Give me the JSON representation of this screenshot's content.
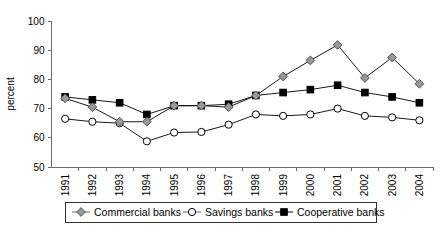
{
  "chart_data": {
    "type": "line",
    "title": "",
    "xlabel": "",
    "ylabel": "percent",
    "categories": [
      "1991",
      "1992",
      "1993",
      "1994",
      "1995",
      "1996",
      "1997",
      "1998",
      "1999",
      "2000",
      "2001",
      "2002",
      "2003",
      "2004"
    ],
    "ylim": [
      50,
      100
    ],
    "yticks": [
      50,
      60,
      70,
      80,
      90,
      100
    ],
    "grid": false,
    "legend_position": "bottom",
    "series": [
      {
        "name": "Commercial banks",
        "marker": "diamond",
        "marker_fill": "#999999",
        "marker_stroke": "#555555",
        "line_color": "#6b6b6b",
        "values": [
          73.5,
          70.5,
          65.5,
          65.5,
          71.0,
          71.0,
          70.5,
          74.5,
          81.0,
          86.5,
          91.8,
          80.5,
          87.5,
          78.5
        ]
      },
      {
        "name": "Savings banks",
        "marker": "circle",
        "marker_fill": "#ffffff",
        "marker_stroke": "#000000",
        "line_color": "#6b6b6b",
        "values": [
          66.5,
          65.5,
          65.0,
          58.8,
          61.8,
          62.0,
          64.5,
          68.0,
          67.5,
          68.0,
          70.0,
          67.5,
          67.0,
          66.0
        ]
      },
      {
        "name": "Cooperative banks",
        "marker": "square",
        "marker_fill": "#000000",
        "marker_stroke": "#000000",
        "line_color": "#000000",
        "values": [
          74.0,
          73.0,
          72.0,
          68.0,
          71.0,
          71.0,
          71.5,
          74.5,
          75.5,
          76.5,
          78.0,
          75.5,
          74.0,
          72.0
        ]
      }
    ]
  },
  "axis": {
    "y_title": "percent",
    "y_tick_labels": [
      "100",
      "90",
      "80",
      "70",
      "60",
      "50"
    ],
    "x_tick_labels": [
      "1991",
      "1992",
      "1993",
      "1994",
      "1995",
      "1996",
      "1997",
      "1998",
      "1999",
      "2000",
      "2001",
      "2002",
      "2003",
      "2004"
    ]
  },
  "legend": {
    "items": [
      {
        "label": "Commercial banks",
        "marker": "diamond-icon"
      },
      {
        "label": "Savings banks",
        "marker": "circle-icon"
      },
      {
        "label": "Cooperative banks",
        "marker": "square-icon"
      }
    ]
  },
  "colors": {
    "axis": "#6b6b6b",
    "commercial_marker": "#999999",
    "savings_marker": "#ffffff",
    "cooperative_marker": "#000000",
    "text": "#000000",
    "background": "#ffffff"
  }
}
